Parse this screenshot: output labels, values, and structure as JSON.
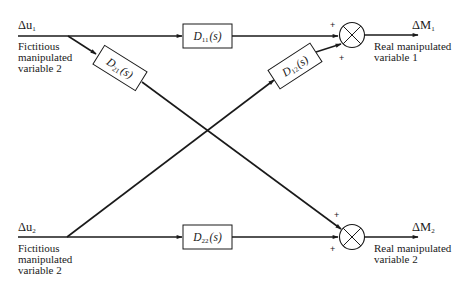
{
  "diagram": {
    "type": "decoupling-control-block-diagram",
    "inputs": [
      {
        "id": "du1",
        "symbol": "Δu",
        "subscript": "1",
        "caption": [
          "Fictitious",
          "manipulated",
          "variable 2"
        ]
      },
      {
        "id": "du2",
        "symbol": "Δu",
        "subscript": "2",
        "caption": [
          "Fictitious",
          "manipulated",
          "variable 2"
        ]
      }
    ],
    "blocks": [
      {
        "id": "D11",
        "label": "D",
        "subscript": "11",
        "arg": "(s)"
      },
      {
        "id": "D21",
        "label": "D",
        "subscript": "21",
        "arg": "(s)"
      },
      {
        "id": "D12",
        "label": "D",
        "subscript": "12",
        "arg": "(s)"
      },
      {
        "id": "D22",
        "label": "D",
        "subscript": "22",
        "arg": "(s)"
      }
    ],
    "junctions": [
      {
        "id": "sum1",
        "signs": [
          "+",
          "+"
        ]
      },
      {
        "id": "sum2",
        "signs": [
          "+",
          "+"
        ]
      }
    ],
    "outputs": [
      {
        "id": "dM1",
        "symbol": "ΔM",
        "subscript": "1",
        "caption": [
          "Real manipulated",
          "variable 1"
        ]
      },
      {
        "id": "dM2",
        "symbol": "ΔM",
        "subscript": "2",
        "caption": [
          "Real manipulated",
          "variable 2"
        ]
      }
    ],
    "connections": [
      {
        "from": "du1",
        "to": "D11"
      },
      {
        "from": "D11",
        "to": "sum1"
      },
      {
        "from": "du1",
        "to": "D21"
      },
      {
        "from": "D21",
        "to": "sum2"
      },
      {
        "from": "du2",
        "to": "D12"
      },
      {
        "from": "D12",
        "to": "sum1"
      },
      {
        "from": "du2",
        "to": "D22"
      },
      {
        "from": "D22",
        "to": "sum2"
      },
      {
        "from": "sum1",
        "to": "dM1"
      },
      {
        "from": "sum2",
        "to": "dM2"
      }
    ],
    "colors": {
      "line": "#1a1a1a",
      "background": "#ffffff"
    }
  }
}
